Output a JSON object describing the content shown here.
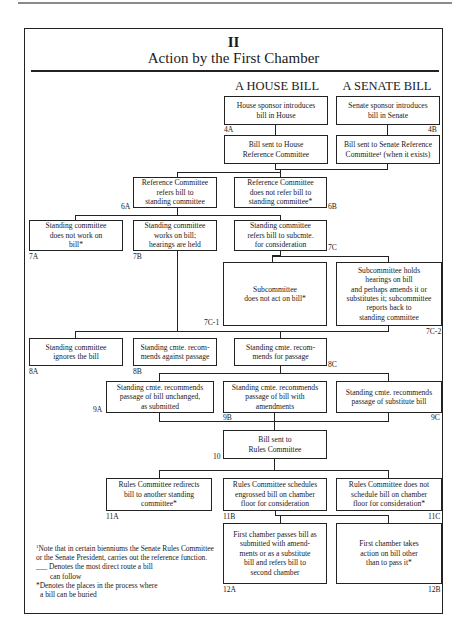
{
  "page": {
    "section_number": "II",
    "title": "Action by the First Chamber",
    "columns": {
      "house": "A HOUSE BILL",
      "senate": "A SENATE BILL"
    }
  },
  "nodes": {
    "4A": {
      "id": "4A",
      "text": "House sponsor introduces\nbill in House"
    },
    "4B": {
      "id": "4B",
      "text": "Senate sponsor introduces\nbill in Senate"
    },
    "5A": {
      "id": "",
      "text": "Bill sent to House\nReference Committee"
    },
    "5B": {
      "id": "",
      "text": "Bill sent to Senate Reference\nCommittee¹ (when it exists)"
    },
    "6A": {
      "id": "6A",
      "text": "Reference Committee\nrefers bill to\nstanding committee"
    },
    "6B": {
      "id": "6B",
      "text": "Reference Committee\ndoes not refer bill to\nstanding committee*"
    },
    "7A": {
      "id": "7A",
      "text": "Standing committee\ndoes not work on\nbill*"
    },
    "7B": {
      "id": "7B",
      "text": "Standing committee\nworks on bill;\nhearings are held"
    },
    "7C": {
      "id": "7C",
      "text": "Standing committee\nrefers bill to subcmte.\nfor consideration"
    },
    "7C-1": {
      "id": "7C-1",
      "text": "Subcommittee\ndoes not act on bill*"
    },
    "7C-2": {
      "id": "7C-2",
      "text": "Subcommittee holds\nhearings on bill\nand perhaps amends it or\nsubstitutes it; subcommittee\nreports back to\nstanding committee"
    },
    "8A": {
      "id": "8A",
      "text": "Standing committee\nignores the bill"
    },
    "8B": {
      "id": "8B",
      "text": "Standing cmte. recom-\nmends against passage"
    },
    "8C": {
      "id": "8C",
      "text": "Standing cmte. recom-\nmends for passage"
    },
    "9A": {
      "id": "9A",
      "text": "Standing cmte. recommends\npassage of bill unchanged,\nas submitted"
    },
    "9B": {
      "id": "9B",
      "text": "Standing cmte. recommends\npassage of bill with\namendments"
    },
    "9C": {
      "id": "9C",
      "text": "Standing cmte. recommends\npassage of substitute bill"
    },
    "10": {
      "id": "10",
      "text": "Bill sent to\nRules Committee"
    },
    "11A": {
      "id": "11A",
      "text": "Rules Committee redirects\nbill to another standing\ncommittee*"
    },
    "11B": {
      "id": "11B",
      "text": "Rules Committee schedules\nengrossed bill on chamber\nfloor for consideration"
    },
    "11C": {
      "id": "11C",
      "text": "Rules Committee does not\nschedule bill on chamber\nfloor for consideration*"
    },
    "12A": {
      "id": "12A",
      "text": "First chamber passes bill as\nsubmitted with amend-\nments or as a substitute\nbill and refers bill to\nsecond chamber"
    },
    "12B": {
      "id": "12B",
      "text": "First chamber takes\naction on bill other\nthan to pass it*"
    }
  },
  "notes": {
    "footnote_mark": "1",
    "footnote": "Note that in certain bienniums the Senate Rules Committee or the Senate President, carries out the reference function.",
    "direct_route_symbol": "___",
    "direct_route": "Denotes the most direct route a bill",
    "direct_route_cont": "can follow",
    "buried": "*Denotes the places in the process where",
    "buried_cont": "a bill can be buried"
  }
}
